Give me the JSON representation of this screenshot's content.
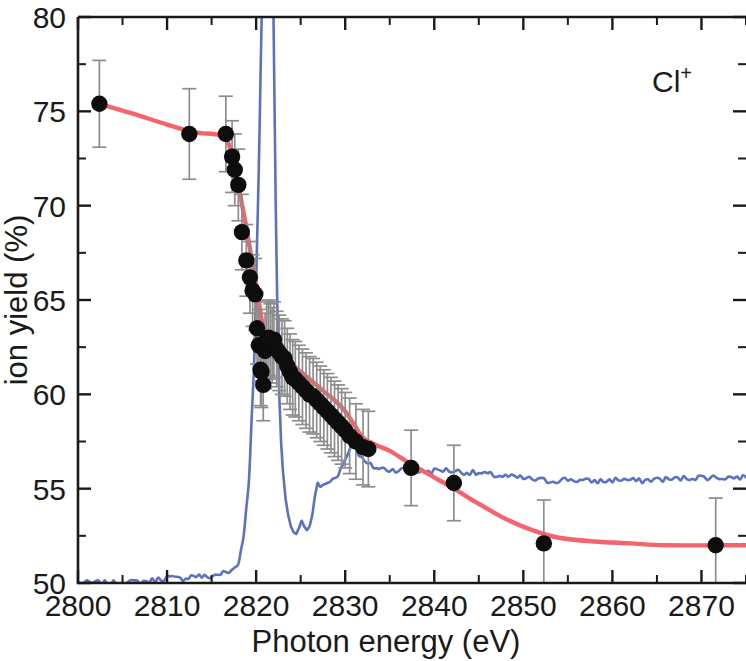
{
  "figure": {
    "series_label": "Cl",
    "series_charge": "+",
    "background": "#ffffff"
  },
  "colors": {
    "fit_curve": "#f4646d",
    "absorption_curve": "#5a72c0",
    "marker": "#0d0d0d",
    "errorbar": "#8d8d8d",
    "axis": "#1a1a1a"
  },
  "chart_data": {
    "type": "scatter",
    "title": "",
    "subtitle": "",
    "xlabel": "Photon energy (eV)",
    "ylabel": "ion yield (%)",
    "xlim": [
      2800,
      2875
    ],
    "ylim": [
      50,
      80
    ],
    "xticks": [
      2800,
      2810,
      2820,
      2830,
      2840,
      2850,
      2860,
      2870
    ],
    "xtick_labels": [
      "2800",
      "2810",
      "2820",
      "2830",
      "2840",
      "2850",
      "2860",
      "2870"
    ],
    "x_minor_step": 5,
    "yticks": [
      50,
      55,
      60,
      65,
      70,
      75,
      80
    ],
    "ytick_labels": [
      "50",
      "55",
      "60",
      "65",
      "70",
      "75",
      "80"
    ],
    "y_minor_step": 2.5,
    "grid": false,
    "legend": "none",
    "annotations": [
      {
        "text": "Cl+",
        "x": 2866,
        "y": 77.5
      }
    ],
    "series": [
      {
        "name": "Cl+ ion yield",
        "type": "scatter",
        "marker": "circle",
        "color": "#0d0d0d",
        "x": [
          2802.4,
          2812.5,
          2816.6,
          2817.3,
          2817.6,
          2818.0,
          2818.4,
          2818.9,
          2819.3,
          2819.6,
          2819.9,
          2820.1,
          2820.3,
          2820.5,
          2820.6,
          2820.8,
          2821.0,
          2821.2,
          2821.4,
          2821.6,
          2821.8,
          2822.0,
          2822.3,
          2822.6,
          2822.9,
          2823.2,
          2823.5,
          2823.8,
          2824.1,
          2824.4,
          2824.8,
          2825.2,
          2825.6,
          2826.0,
          2826.4,
          2826.8,
          2827.2,
          2827.6,
          2828.0,
          2828.4,
          2828.8,
          2829.2,
          2829.6,
          2830.0,
          2830.5,
          2831.2,
          2832.0,
          2832.6,
          2837.4,
          2842.2,
          2852.3,
          2871.6
        ],
        "y": [
          75.4,
          73.8,
          73.8,
          72.6,
          71.9,
          71.1,
          68.6,
          67.1,
          66.2,
          65.5,
          65.3,
          63.5,
          62.6,
          61.3,
          61.2,
          60.5,
          62.3,
          62.9,
          63.0,
          62.8,
          62.6,
          62.9,
          62.4,
          62.2,
          62.0,
          61.9,
          61.5,
          61.2,
          60.9,
          60.8,
          60.6,
          60.4,
          60.2,
          60.0,
          59.9,
          59.7,
          59.5,
          59.3,
          59.1,
          58.9,
          58.7,
          58.5,
          58.3,
          58.1,
          57.8,
          57.5,
          57.2,
          57.1,
          56.1,
          55.3,
          52.1,
          52.0
        ],
        "yerr": [
          2.3,
          2.4,
          2.0,
          1.9,
          1.9,
          1.9,
          2.0,
          1.9,
          1.9,
          1.9,
          1.9,
          1.9,
          1.9,
          1.9,
          1.9,
          1.9,
          2.0,
          2.0,
          2.0,
          2.0,
          2.0,
          2.0,
          2.0,
          2.0,
          2.0,
          2.0,
          2.0,
          2.0,
          2.0,
          2.0,
          2.0,
          2.0,
          2.0,
          2.0,
          2.0,
          2.0,
          2.0,
          2.0,
          2.0,
          2.0,
          2.0,
          2.0,
          2.0,
          2.0,
          2.0,
          2.0,
          2.0,
          2.0,
          2.0,
          2.0,
          2.3,
          2.5
        ]
      },
      {
        "name": "fit curve",
        "type": "line",
        "color": "#f4646d",
        "x": [
          2802.4,
          2806.0,
          2810.0,
          2813.0,
          2815.2,
          2816.2,
          2816.8,
          2817.2,
          2817.6,
          2818.0,
          2818.4,
          2818.8,
          2819.2,
          2819.6,
          2820.0,
          2820.4,
          2820.8,
          2821.2,
          2821.6,
          2822.0,
          2822.6,
          2823.2,
          2824.0,
          2825.0,
          2826.0,
          2827.0,
          2828.0,
          2829.0,
          2830.0,
          2831.0,
          2832.0,
          2833.5,
          2835.0,
          2837.4,
          2840.0,
          2842.2,
          2845.0,
          2848.0,
          2851.0,
          2854.0,
          2858.0,
          2862.0,
          2866.0,
          2871.6,
          2875.0
        ],
        "y": [
          75.4,
          74.9,
          74.3,
          73.9,
          73.8,
          73.7,
          73.4,
          72.8,
          72.0,
          71.1,
          70.1,
          69.1,
          68.0,
          66.9,
          65.8,
          64.6,
          63.5,
          63.0,
          62.6,
          62.4,
          62.2,
          62.0,
          61.6,
          61.2,
          60.8,
          60.4,
          60.0,
          59.6,
          59.1,
          58.4,
          57.7,
          57.3,
          57.0,
          56.3,
          55.6,
          55.0,
          54.2,
          53.4,
          52.8,
          52.4,
          52.2,
          52.1,
          52.0,
          52.0,
          52.0
        ]
      },
      {
        "name": "X-ray absorption spectrum",
        "type": "line",
        "color": "#5a72c0",
        "note": "sharp white-line resonance near 2822 eV with double-dip structure near 2824-2827 eV and flat continuum near 55.6%",
        "x": [
          2800.0,
          2805.0,
          2808.0,
          2810.0,
          2811.5,
          2813.0,
          2814.5,
          2816.0,
          2817.2,
          2818.0,
          2818.6,
          2819.2,
          2819.8,
          2820.3,
          2820.7,
          2821.0,
          2821.3,
          2821.6,
          2821.8,
          2822.0,
          2822.2,
          2822.4,
          2822.6,
          2822.8,
          2823.0,
          2823.3,
          2823.6,
          2823.9,
          2824.2,
          2824.5,
          2824.8,
          2825.1,
          2825.4,
          2825.7,
          2826.0,
          2826.3,
          2826.6,
          2826.9,
          2827.2,
          2827.5,
          2828.0,
          2828.6,
          2829.2,
          2829.8,
          2830.3,
          2830.8,
          2831.3,
          2831.8,
          2832.5,
          2833.5,
          2835.0,
          2837.0,
          2839.0,
          2841.0,
          2843.0,
          2845.0,
          2847.0,
          2849.0,
          2851.0,
          2853.0,
          2855.0,
          2857.0,
          2859.0,
          2861.0,
          2863.0,
          2865.0,
          2867.0,
          2869.0,
          2871.0,
          2873.0,
          2875.0
        ],
        "y": [
          50.0,
          50.0,
          50.1,
          50.3,
          50.2,
          50.4,
          50.3,
          50.5,
          50.6,
          51.0,
          52.5,
          55.5,
          62.0,
          72.0,
          82.0,
          90.0,
          94.0,
          92.0,
          86.0,
          78.0,
          70.0,
          64.0,
          60.0,
          57.5,
          56.0,
          54.5,
          53.6,
          53.0,
          52.7,
          52.6,
          52.9,
          53.3,
          53.0,
          52.8,
          53.0,
          53.6,
          54.6,
          55.3,
          55.1,
          55.2,
          55.3,
          55.5,
          55.8,
          56.3,
          56.9,
          57.4,
          57.1,
          56.6,
          56.3,
          56.1,
          56.0,
          56.0,
          55.9,
          56.0,
          55.9,
          55.8,
          55.7,
          55.6,
          55.5,
          55.4,
          55.5,
          55.4,
          55.4,
          55.5,
          55.4,
          55.5,
          55.5,
          55.6,
          55.6,
          55.6,
          55.6
        ]
      }
    ]
  }
}
